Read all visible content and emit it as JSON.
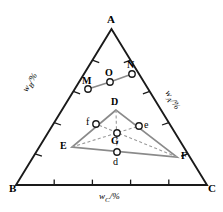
{
  "figure": {
    "type": "ternary-phase-diagram",
    "background": "#ffffff",
    "line_color": "#1a1a1a",
    "inner_color": "#8a8a8a",
    "dashed_color": "#9a9a9a"
  },
  "vertices": {
    "A": {
      "label": "A",
      "x": 111.5,
      "y": 22.0
    },
    "B": {
      "label": "B",
      "x": 18.0,
      "y": 188.0
    },
    "C": {
      "label": "C",
      "x": 205.0,
      "y": 188.0
    }
  },
  "axes": {
    "left": {
      "label": "w",
      "sub": "B",
      "unit": "/%",
      "full": "wB/%",
      "rotation": -60
    },
    "right": {
      "label": "w",
      "sub": "A",
      "unit": "/%",
      "full": "wA/%",
      "rotation": 60
    },
    "bottom": {
      "label": "w",
      "sub": "C",
      "unit": "/%",
      "full": "wC/%",
      "rotation": 0
    }
  },
  "ticks": {
    "per_edge": 4
  },
  "tie_line": {
    "name": "MON",
    "points": [
      {
        "label": "M",
        "x": 88.0,
        "y": 89.0,
        "label_dx": -2,
        "label_dy": -13
      },
      {
        "label": "O",
        "x": 110.0,
        "y": 82.0,
        "label_dx": -2,
        "label_dy": -13
      },
      {
        "label": "N",
        "x": 132.0,
        "y": 74.0,
        "label_dx": -2,
        "label_dy": -13
      }
    ]
  },
  "inner_triangle": {
    "name": "DEF",
    "vertices": [
      {
        "label": "D",
        "x": 116.0,
        "y": 110.0,
        "label_dx": -3,
        "label_dy": -13
      },
      {
        "label": "E",
        "x": 72.0,
        "y": 147.0,
        "label_dx": -13,
        "label_dy": -5
      },
      {
        "label": "F",
        "x": 177.0,
        "y": 157.0,
        "label_dx": 5,
        "label_dy": -5
      }
    ],
    "edge_points": [
      {
        "label": "f",
        "x": 96.0,
        "y": 124.0,
        "label_dx": -10,
        "label_dy": -5
      },
      {
        "label": "e",
        "x": 139.0,
        "y": 126.0,
        "label_dx": 6,
        "label_dy": -2
      },
      {
        "label": "d",
        "x": 117.0,
        "y": 152.0,
        "label_dx": -3,
        "label_dy": 9
      }
    ],
    "centroid": {
      "label": "G",
      "x": 117.0,
      "y": 133.0,
      "label_dx": -4,
      "label_dy": 10
    }
  },
  "marker": {
    "radius": 3.2,
    "fill": "#ffffff",
    "stroke": "#1a1a1a",
    "stroke_width": 1.4
  }
}
